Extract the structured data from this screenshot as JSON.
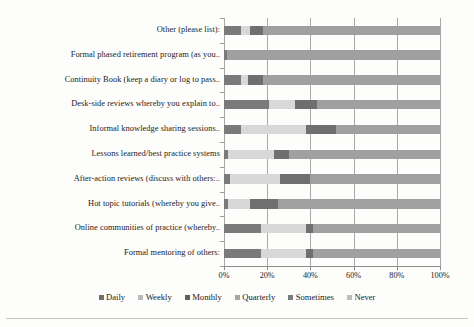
{
  "chart_data": {
    "type": "bar",
    "orientation": "horizontal",
    "stacked": true,
    "stacked_percent": true,
    "title": "",
    "xlabel": "",
    "ylabel": "",
    "xlim": [
      0,
      100
    ],
    "xticks": [
      0,
      20,
      40,
      60,
      80,
      100
    ],
    "xtick_labels": [
      "0%",
      "20%",
      "40%",
      "60%",
      "80%",
      "100%"
    ],
    "grid": true,
    "legend_position": "bottom",
    "categories": [
      "Other (please list):",
      "Formal phased retirement program (as you..",
      "Continuity Book (keep a diary or log to pass..",
      "Desk-side reviews whereby you explain to..",
      "Informal knowledge sharing sessions..",
      "Lessons learned/best practice systems",
      "After-action reviews (discuss with others:..",
      "Hot topic tutorials (whereby you give..",
      "Online communities of practice (whereby..",
      "Formal mentoring of others:"
    ],
    "series": [
      {
        "name": "Daily",
        "color": "#7a7a7a",
        "values": [
          8.0,
          1.5,
          8.0,
          21.0,
          8.0,
          2.0,
          3.0,
          2.0,
          17.0,
          17.0
        ]
      },
      {
        "name": "Weekly",
        "color": "#d8d8d8",
        "values": [
          4.0,
          0.0,
          3.0,
          12.0,
          30.0,
          21.0,
          23.0,
          10.0,
          21.0,
          21.0
        ]
      },
      {
        "name": "Monthly",
        "color": "#6f6f6f",
        "values": [
          6.0,
          0.0,
          7.0,
          10.0,
          14.0,
          7.0,
          14.0,
          13.0,
          3.0,
          3.0
        ]
      },
      {
        "name": "Quarterly",
        "color": "#b5b5b5",
        "values": [
          0.0,
          0.0,
          0.0,
          0.0,
          0.0,
          0.0,
          0.0,
          0.0,
          0.0,
          0.0
        ]
      },
      {
        "name": "Sometimes",
        "color": "#8f8f8f",
        "values": [
          0.0,
          0.0,
          0.0,
          0.0,
          0.0,
          0.0,
          0.0,
          0.0,
          0.0,
          0.0
        ]
      },
      {
        "name": "Never",
        "color": "#a0a0a0",
        "values": [
          82.0,
          98.5,
          82.0,
          57.0,
          48.0,
          70.0,
          60.0,
          75.0,
          59.0,
          59.0
        ]
      }
    ],
    "legend": [
      "Daily",
      "Weekly",
      "Monthly",
      "Quarterly",
      "Sometimes",
      "Never"
    ],
    "legend_colors": [
      "#6f6f6f",
      "#b9b9b9",
      "#5f5f5f",
      "#a5a5a5",
      "#7c7c7c",
      "#bdbdbd"
    ]
  }
}
